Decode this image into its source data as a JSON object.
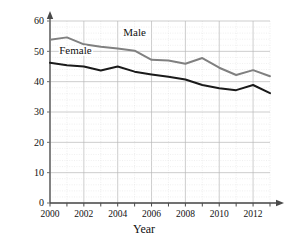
{
  "chart_data": {
    "type": "line",
    "title": "",
    "xlabel": "Year",
    "ylabel": "Percent of 12th graders drinking",
    "xlim": [
      2000,
      2013
    ],
    "ylim": [
      0,
      60
    ],
    "ytick_values": [
      0,
      10,
      20,
      30,
      40,
      50,
      60
    ],
    "ytick_labels": [
      "0",
      "10",
      "20",
      "30",
      "40",
      "50",
      "60"
    ],
    "xtick_values": [
      2000,
      2001,
      2002,
      2003,
      2004,
      2005,
      2006,
      2007,
      2008,
      2009,
      2010,
      2011,
      2012,
      2013
    ],
    "xtick_labels": [
      "2000",
      "",
      "2002",
      "",
      "2004",
      "",
      "2006",
      "",
      "2008",
      "",
      "2010",
      "",
      "2012",
      ""
    ],
    "x": [
      2000,
      2001,
      2002,
      2003,
      2004,
      2005,
      2006,
      2007,
      2008,
      2009,
      2010,
      2011,
      2012,
      2013
    ],
    "grid": true,
    "legend": "inline-labels",
    "series": [
      {
        "name": "Male",
        "color": "#808080",
        "label_x": 2005,
        "label_y": 55,
        "values": [
          53.8,
          54.6,
          52.3,
          51.5,
          50.9,
          50.2,
          47.2,
          47.0,
          45.9,
          47.8,
          44.6,
          42.2,
          43.8,
          41.8
        ]
      },
      {
        "name": "Female",
        "color": "#1a1a1a",
        "label_x": 2001.5,
        "label_y": 49,
        "values": [
          46.2,
          45.4,
          45.0,
          43.7,
          45.0,
          43.3,
          42.4,
          41.6,
          40.7,
          38.9,
          37.8,
          37.2,
          38.9,
          36.2
        ]
      }
    ]
  },
  "axis": {
    "y_title": "Percent of 12th graders drinking",
    "x_title": "Year"
  }
}
